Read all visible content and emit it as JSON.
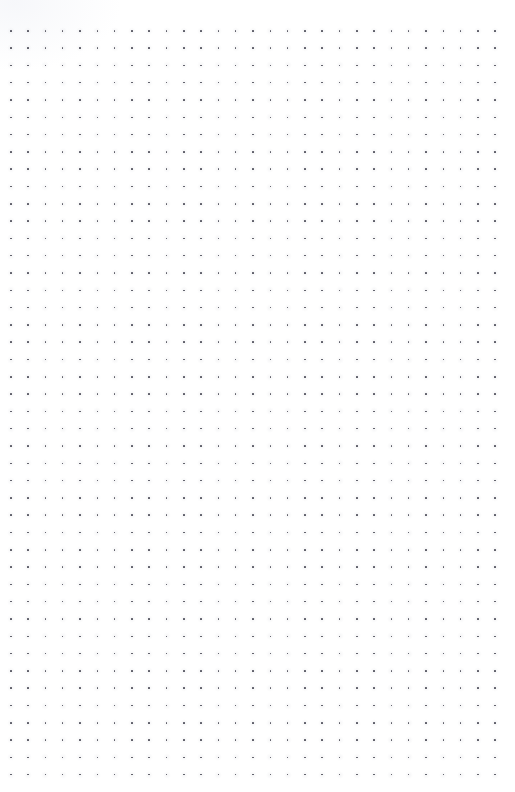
{
  "page": {
    "kind": "dot-grid-paper",
    "width": 515,
    "height": 792,
    "background_color": "#ffffff",
    "has_text": false,
    "has_ui_chrome": false
  },
  "grid": {
    "dot_color": "#5a5a64",
    "dot_size_px": 1.6,
    "spacing_px": 17.3,
    "origin_x_px": 10,
    "origin_y_px": 30,
    "columns": 29,
    "rows": 44,
    "margin_left_px": 10,
    "margin_top_px": 30,
    "margin_right_px": 21,
    "margin_bottom_px": 24
  },
  "sheen": {
    "description": "faint light corner gradient",
    "color": "#f6f7fa"
  }
}
